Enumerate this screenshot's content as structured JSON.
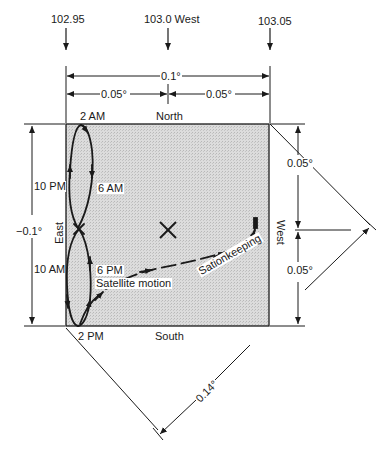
{
  "longitude_markers": [
    {
      "label": "102.95"
    },
    {
      "label": "103.0 West"
    },
    {
      "label": "103.05"
    }
  ],
  "dimensions": {
    "total_width": "0.1°",
    "half_width_left": "0.05°",
    "half_width_right": "0.05°",
    "total_height": "−0.1°",
    "half_height_upper": "0.05°",
    "half_height_lower": "0.05°",
    "diagonal": "0.14°"
  },
  "directions": {
    "north": "North",
    "south": "South",
    "east": "East",
    "west": "West"
  },
  "time_labels": {
    "t2am": "2 AM",
    "t6am": "6 AM",
    "t10pm": "10 PM",
    "t10am": "10 AM",
    "t6pm": "6 PM",
    "t2pm": "2 PM"
  },
  "annotations": {
    "satellite_motion": "Satellite motion",
    "stationkeeping": "Sationkeeping"
  },
  "colors": {
    "box_fill": "#d4d4d4",
    "line": "#1a1a1a"
  }
}
